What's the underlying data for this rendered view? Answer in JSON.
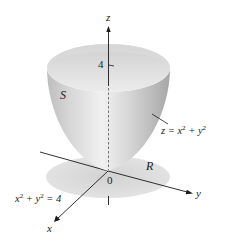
{
  "figure": {
    "type": "3d-surface-diagram",
    "axes": {
      "z": {
        "label": "z"
      },
      "y": {
        "label": "y"
      },
      "x": {
        "label": "x"
      },
      "origin": {
        "label": "0"
      }
    },
    "tick_labels": {
      "z_height": "4"
    },
    "region_labels": {
      "surface": "S",
      "region": "R"
    },
    "equations": {
      "surface": {
        "lhs": "z = x",
        "exp1": "2",
        "mid": " + y",
        "exp2": "2"
      },
      "boundary": {
        "lhs": "x",
        "exp1": "2",
        "mid": " + y",
        "exp2": "2",
        "rhs": " = 4"
      }
    },
    "colors": {
      "surface_light": "#efefef",
      "surface_mid": "#cfcfcf",
      "surface_dark": "#a9a9a9",
      "rim_inner": "#e4e4e4",
      "shadow_region": "#dcdcdc",
      "axis": "#1a1a1a"
    }
  }
}
